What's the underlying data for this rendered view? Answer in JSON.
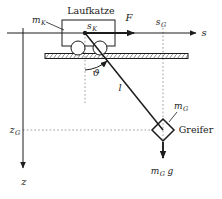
{
  "colors": {
    "line": "#1c1c1c",
    "dotted": "#8f8f8f",
    "text": "#222222",
    "bg": "#ffffff"
  },
  "diagram": {
    "trolley": {
      "label": "Laufkatze",
      "mass": {
        "base": "m",
        "sub": "K"
      },
      "position": {
        "base": "s",
        "sub": "K"
      }
    },
    "force": {
      "label": "F"
    },
    "axes": {
      "s": {
        "label": "s"
      },
      "z": {
        "label": "z"
      },
      "s_g": {
        "base": "s",
        "sub": "G"
      },
      "z_g": {
        "base": "z",
        "sub": "G"
      }
    },
    "pendulum": {
      "angle": "ϑ",
      "length": "l"
    },
    "gripper": {
      "label": "Greifer",
      "mass": {
        "base": "m",
        "sub": "G"
      },
      "weight": {
        "base": "m",
        "sub": "G",
        "factor": "g"
      }
    }
  }
}
